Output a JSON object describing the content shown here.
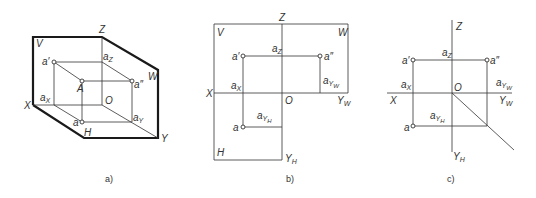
{
  "figure": {
    "panels": [
      {
        "id": "a",
        "caption": "a)",
        "type": "pictorial-three-plane-projection",
        "plane_labels": {
          "V": "V",
          "W": "W",
          "H": "H"
        },
        "axis_labels": {
          "X": "X",
          "Y": "Y",
          "Z": "Z",
          "O": "O"
        },
        "point_labels": {
          "A": "A",
          "a_front": "a′",
          "a_side": "a″",
          "a_top": "a",
          "a_x": "a",
          "a_x_sub": "X",
          "a_z": "a",
          "a_z_sub": "Z",
          "a_y": "a",
          "a_y_sub": "Y"
        }
      },
      {
        "id": "b",
        "caption": "b)",
        "type": "unfolded-projection-with-frames",
        "plane_labels": {
          "V": "V",
          "W": "W",
          "H": "H"
        },
        "axis_labels": {
          "X": "X",
          "Z": "Z",
          "O": "O",
          "YW": "Y",
          "YW_sub": "W",
          "YH": "Y",
          "YH_sub": "H"
        },
        "point_labels": {
          "a_front": "a′",
          "a_side": "a″",
          "a_top": "a",
          "a_x": "a",
          "a_x_sub": "X",
          "a_z": "a",
          "a_z_sub": "Z",
          "a_yw": "a",
          "a_yw_sub": "Y",
          "a_yw_subsub": "W",
          "a_yh": "a",
          "a_yh_sub": "Y",
          "a_yh_subsub": "H"
        }
      },
      {
        "id": "c",
        "caption": "c)",
        "type": "unfolded-projection-with-45-degree-line",
        "axis_labels": {
          "X": "X",
          "Z": "Z",
          "O": "O",
          "YW": "Y",
          "YW_sub": "W",
          "YH": "Y",
          "YH_sub": "H"
        },
        "point_labels": {
          "a_front": "a′",
          "a_side": "a″",
          "a_top": "a",
          "a_x": "a",
          "a_x_sub": "X",
          "a_z": "a",
          "a_z_sub": "Z",
          "a_yw": "a",
          "a_yw_sub": "Y",
          "a_yw_subsub": "W",
          "a_yh": "a",
          "a_yh_sub": "Y",
          "a_yh_subsub": "H"
        }
      }
    ],
    "colors": {
      "line": "#333333",
      "frame": "#1a1a1a",
      "background": "#ffffff"
    }
  }
}
